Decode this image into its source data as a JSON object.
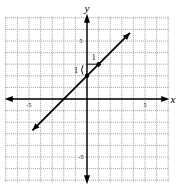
{
  "chart_data": {
    "type": "line",
    "title": "",
    "xlabel": "x",
    "ylabel": "y",
    "xlim": [
      -7,
      7
    ],
    "ylim": [
      -7,
      7
    ],
    "grid": true,
    "x_ticks_labeled": [
      -5,
      5
    ],
    "y_ticks_labeled": [
      5,
      -5
    ],
    "tick_labels": {
      "x_neg": "-5",
      "x_pos": "5",
      "y_pos": "5",
      "y_neg": "-5"
    },
    "series": [
      {
        "name": "y = x + 2",
        "slope": 1,
        "intercept": 2,
        "x": [
          -4.7,
          3.7
        ],
        "y": [
          -2.7,
          5.7
        ],
        "points": [
          [
            0,
            2
          ],
          [
            1,
            3
          ]
        ]
      }
    ],
    "annotations": [
      {
        "text": "1",
        "meaning": "run",
        "position": "above segment from (0,2)-(1,3)"
      },
      {
        "text": "1",
        "meaning": "rise",
        "position": "left of y-axis near (0,2)"
      }
    ]
  }
}
